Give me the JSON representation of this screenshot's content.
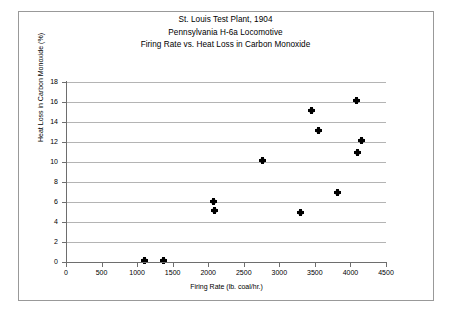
{
  "figure": {
    "title_lines": [
      "St. Louis Test Plant, 1904",
      "Pennsylvania H-6a Locomotive",
      "Firing Rate vs. Heat Loss in Carbon Monoxide"
    ]
  },
  "chart_data": {
    "type": "scatter",
    "xlabel": "Firing Rate (lb. coal/hr.)",
    "ylabel": "Heat Loss in Carbon Monoxide (%)",
    "xlim": [
      0,
      4500
    ],
    "ylim": [
      0,
      18
    ],
    "xticks": [
      0,
      500,
      1000,
      1500,
      2000,
      2500,
      3000,
      3500,
      4000,
      4500
    ],
    "yticks": [
      0,
      2,
      4,
      6,
      8,
      10,
      12,
      14,
      16,
      18
    ],
    "grid": "horizontal",
    "legend": "none",
    "marker": "diamond",
    "marker_color": "#000000",
    "points": [
      {
        "x": 1100,
        "y": 0.2
      },
      {
        "x": 1370,
        "y": 0.15
      },
      {
        "x": 2080,
        "y": 6.1
      },
      {
        "x": 2090,
        "y": 5.2
      },
      {
        "x": 2760,
        "y": 10.2
      },
      {
        "x": 3300,
        "y": 5.0
      },
      {
        "x": 3450,
        "y": 15.2
      },
      {
        "x": 3550,
        "y": 13.2
      },
      {
        "x": 3820,
        "y": 7.0
      },
      {
        "x": 4080,
        "y": 16.2
      },
      {
        "x": 4100,
        "y": 11.0
      },
      {
        "x": 4150,
        "y": 12.2
      }
    ]
  }
}
